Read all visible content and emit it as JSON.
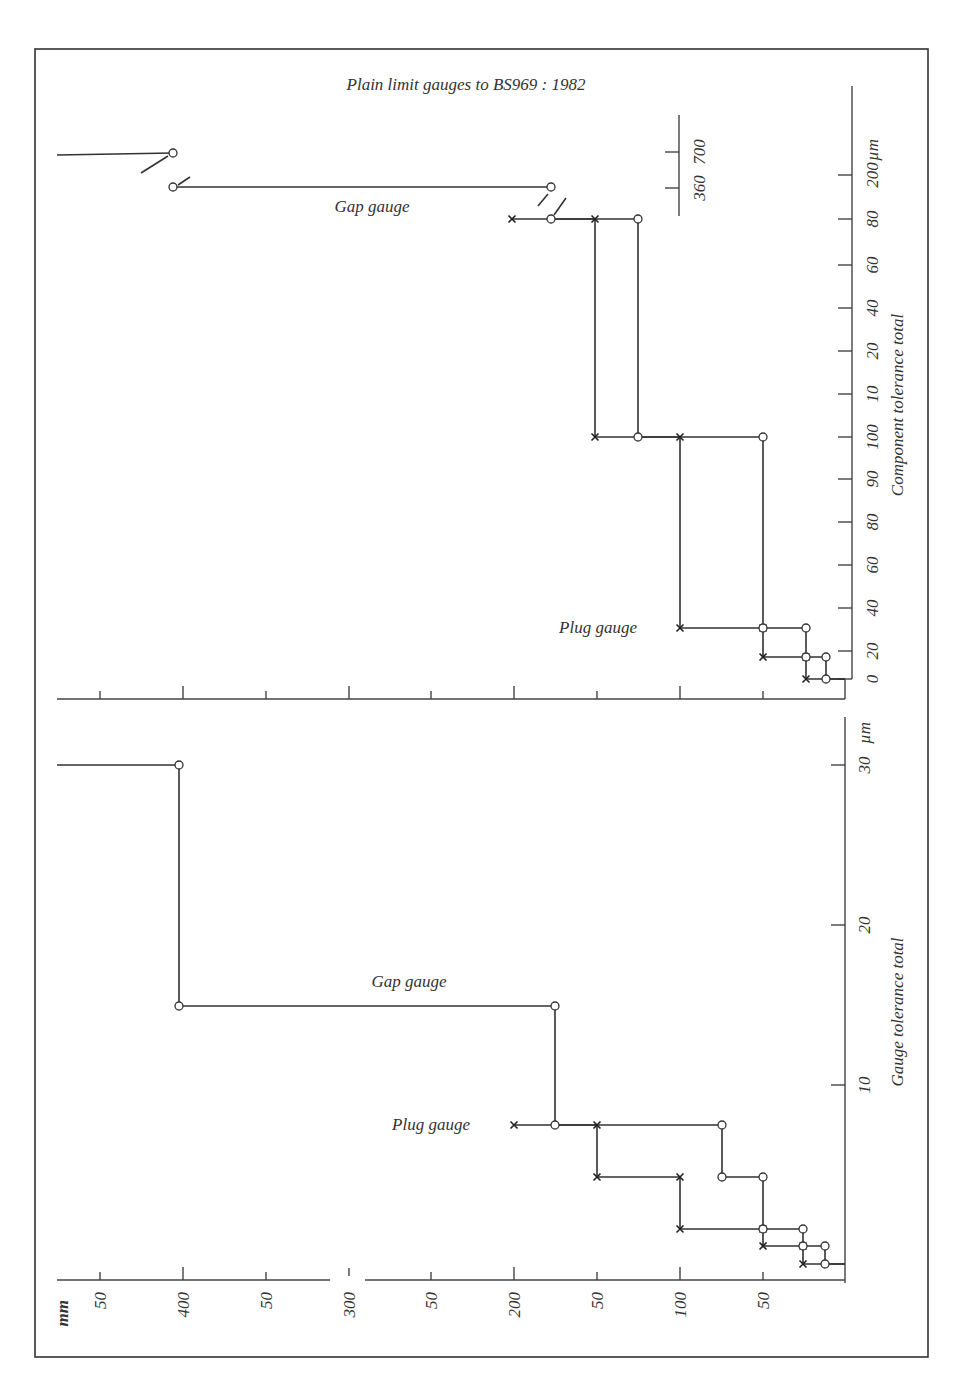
{
  "page": {
    "title": "Plain limit gauges to BS969 : 1982",
    "frame_color": "#333333"
  },
  "chart_data": [
    {
      "type": "line",
      "panel": "top",
      "title": "Plain limit gauges to BS969 : 1982",
      "orientation": "rotated 90° (size axis horizontal, tolerance axis vertical)",
      "xlabel": "mm",
      "ylabel": "Component tolerance total",
      "yunit": "µm",
      "y_tick_labels": [
        "0",
        "20",
        "40",
        "60",
        "80",
        "90",
        "100",
        "10",
        "20",
        "40",
        "60",
        "80",
        "200"
      ],
      "y_secondary_tick_labels": [
        "360",
        "700"
      ],
      "x_tick_labels": [
        "50",
        "400",
        "50",
        "300",
        "50",
        "200",
        "50",
        "100",
        "50"
      ],
      "annotations": [
        "Gap gauge",
        "Plug gauge"
      ],
      "series": [
        {
          "name": "Gap gauge",
          "marker": "circle",
          "points_px": [
            [
              57,
              155
            ],
            [
              173,
              153
            ],
            [
              173,
              187
            ],
            [
              551,
              187
            ],
            [
              551,
              219
            ],
            [
              638,
              219
            ],
            [
              638,
              437
            ],
            [
              763,
              437
            ],
            [
              763,
              628
            ],
            [
              806,
              628
            ],
            [
              806,
              657
            ],
            [
              826,
              657
            ],
            [
              826,
              679
            ],
            [
              845,
              679
            ]
          ]
        },
        {
          "name": "Plug gauge",
          "marker": "cross",
          "points_px": [
            [
              512,
              219
            ],
            [
              595,
              219
            ],
            [
              595,
              437
            ],
            [
              680,
              437
            ],
            [
              680,
              628
            ],
            [
              763,
              628
            ],
            [
              763,
              657
            ],
            [
              806,
              657
            ],
            [
              806,
              679
            ],
            [
              845,
              679
            ]
          ]
        }
      ]
    },
    {
      "type": "line",
      "panel": "bottom",
      "xlabel": "mm",
      "ylabel": "Gauge tolerance total",
      "yunit": "µm",
      "y_tick_labels": [
        "10",
        "20",
        "30"
      ],
      "x_tick_labels": [
        "50",
        "400",
        "50",
        "300",
        "50",
        "200",
        "50",
        "100",
        "50"
      ],
      "annotations": [
        "Gap gauge",
        "Plug gauge"
      ],
      "series": [
        {
          "name": "Gap gauge",
          "marker": "circle",
          "points_px": [
            [
              57,
              765
            ],
            [
              179,
              765
            ],
            [
              179,
              1006
            ],
            [
              555,
              1006
            ],
            [
              555,
              1125
            ],
            [
              722,
              1125
            ],
            [
              722,
              1177
            ],
            [
              763,
              1177
            ],
            [
              763,
              1229
            ],
            [
              803,
              1229
            ],
            [
              803,
              1246
            ],
            [
              825,
              1246
            ],
            [
              825,
              1264
            ],
            [
              845,
              1264
            ]
          ]
        },
        {
          "name": "Plug gauge",
          "marker": "cross",
          "points_px": [
            [
              514,
              1125
            ],
            [
              597,
              1125
            ],
            [
              597,
              1177
            ],
            [
              680,
              1177
            ],
            [
              680,
              1229
            ],
            [
              763,
              1229
            ],
            [
              763,
              1246
            ],
            [
              803,
              1246
            ],
            [
              803,
              1264
            ],
            [
              845,
              1264
            ]
          ]
        }
      ]
    }
  ],
  "labels": {
    "title": "Plain limit gauges to BS969 : 1982",
    "top_gap": "Gap gauge",
    "top_plug": "Plug gauge",
    "bottom_gap": "Gap gauge",
    "bottom_plug": "Plug gauge",
    "top_ylabel": "Component tolerance total",
    "bottom_ylabel": "Gauge tolerance total",
    "um": "µm",
    "mm": "mm"
  },
  "top_axis": {
    "ticks": [
      {
        "label": "0",
        "y": 679
      },
      {
        "label": "20",
        "y": 651
      },
      {
        "label": "40",
        "y": 608
      },
      {
        "label": "60",
        "y": 565
      },
      {
        "label": "80",
        "y": 522
      },
      {
        "label": "90",
        "y": 479
      },
      {
        "label": "100",
        "y": 437
      },
      {
        "label": "10",
        "y": 394
      },
      {
        "label": "20",
        "y": 351
      },
      {
        "label": "40",
        "y": 308
      },
      {
        "label": "60",
        "y": 265
      },
      {
        "label": "80",
        "y": 219
      },
      {
        "label": "200",
        "y": 175
      }
    ],
    "secondary": [
      {
        "label": "700",
        "y": 152
      },
      {
        "label": "360",
        "y": 188
      }
    ]
  },
  "bottom_axis": {
    "ticks": [
      {
        "label": "30",
        "y": 765
      },
      {
        "label": "20",
        "y": 925
      },
      {
        "label": "10",
        "y": 1085
      }
    ]
  },
  "x_axis": {
    "ticks": [
      {
        "label": "50",
        "x": 100
      },
      {
        "label": "400",
        "x": 183
      },
      {
        "label": "50",
        "x": 266
      },
      {
        "label": "300",
        "x": 349
      },
      {
        "label": "50",
        "x": 431
      },
      {
        "label": "200",
        "x": 514
      },
      {
        "label": "50",
        "x": 597
      },
      {
        "label": "100",
        "x": 680
      },
      {
        "label": "50",
        "x": 763
      }
    ]
  }
}
